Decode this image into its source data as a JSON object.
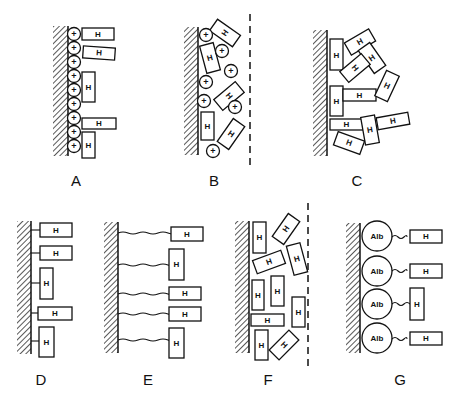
{
  "figure": {
    "panels": [
      {
        "id": "A",
        "label": "A",
        "description": "Heparin (H) adsorbed on positively charged (+) surface layer"
      },
      {
        "id": "B",
        "label": "B",
        "description": "Heparin and cationic charges in a diffuse layer bounded by dashed line"
      },
      {
        "id": "C",
        "label": "C",
        "description": "Heparin molecules aggregated on surface"
      },
      {
        "id": "D",
        "label": "D",
        "description": "Heparin covalently bound directly to surface"
      },
      {
        "id": "E",
        "label": "E",
        "description": "Heparin bound via long flexible spacer arms"
      },
      {
        "id": "F",
        "label": "F",
        "description": "Heparin dispersed in a layer bounded by dashed line"
      },
      {
        "id": "G",
        "label": "G",
        "description": "Heparin bound via albumin (Alb) spacers"
      }
    ],
    "glyphs": {
      "heparin": "H",
      "charge": "+",
      "albumin": "Alb"
    },
    "colors": {
      "ink": "#111111",
      "background": "#ffffff"
    }
  }
}
